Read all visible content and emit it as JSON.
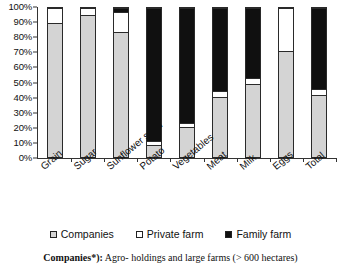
{
  "chart_data": {
    "type": "bar",
    "subtype": "100% stacked column",
    "title": "",
    "xlabel": "",
    "ylabel": "",
    "ylim": [
      0,
      100
    ],
    "ytick_labels": [
      "0%",
      "10%",
      "20%",
      "30%",
      "40%",
      "50%",
      "60%",
      "70%",
      "80%",
      "90%",
      "100%"
    ],
    "ytick_values": [
      0,
      10,
      20,
      30,
      40,
      50,
      60,
      70,
      80,
      90,
      100
    ],
    "grid": false,
    "legend_position": "bottom",
    "categories": [
      "Grain",
      "Sugar",
      "Sunflower seed",
      "Potato",
      "Vegetables",
      "Meat",
      "Milk",
      "Eggs",
      "Total"
    ],
    "series": [
      {
        "name": "Companies",
        "color": "#d4d4d4",
        "values": [
          90,
          95,
          84,
          8,
          20,
          40,
          49,
          71,
          41.5
        ]
      },
      {
        "name": "Private farm",
        "color": "#ffffff",
        "values": [
          10,
          5,
          13,
          3,
          3,
          4,
          4,
          29,
          4
        ]
      },
      {
        "name": "Family farm",
        "color": "#101010",
        "values": [
          0,
          0,
          3,
          89,
          77,
          56,
          47,
          0,
          54.5
        ]
      }
    ]
  },
  "legend": {
    "items": [
      {
        "label": "Companies",
        "swatch": "companies-swatch"
      },
      {
        "label": "Private farm",
        "swatch": "private-farm-swatch"
      },
      {
        "label": "Family farm",
        "swatch": "family-farm-swatch"
      }
    ]
  },
  "footnote": {
    "bold_prefix": "Companies*):",
    "rest": " Agro- holdings and large farms (> 600 hectares)"
  },
  "colors": {
    "companies": "#d4d4d4",
    "private_farm": "#ffffff",
    "family_farm": "#101010",
    "axis": "#333333",
    "text": "#111111",
    "background": "#ffffff"
  }
}
